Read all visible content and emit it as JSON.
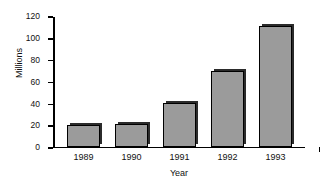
{
  "chart_data": {
    "type": "bar",
    "title": "",
    "xlabel": "Year",
    "ylabel": "Millions",
    "categories": [
      "1989",
      "1990",
      "1991",
      "1992",
      "1993"
    ],
    "values": [
      20,
      21,
      40,
      70,
      112
    ],
    "yticks": [
      "0",
      "20",
      "40",
      "60",
      "80",
      "100",
      "120"
    ],
    "ytick_values": [
      0,
      20,
      40,
      60,
      80,
      100,
      120
    ],
    "ylim": [
      0,
      120
    ],
    "grid": false,
    "legend": null,
    "colors": {
      "bar_fill": "#9b9b9b",
      "bar_edge": "#000000",
      "bar_shadow": "#2b2b2b",
      "axis": "#000000",
      "text": "#111111",
      "background": "#ffffff"
    }
  }
}
